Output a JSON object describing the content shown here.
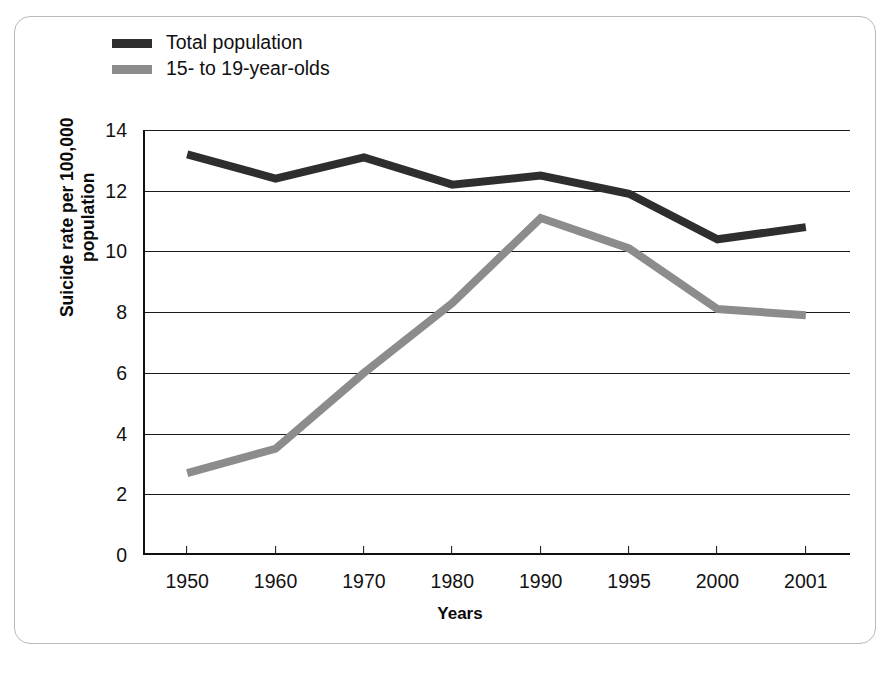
{
  "chart_data": {
    "type": "line",
    "title": "",
    "xlabel": "Years",
    "ylabel": "Suicide rate per 100,000 population",
    "ylabel_lines": [
      "Suicide rate per 100,000",
      "population"
    ],
    "categories": [
      "1950",
      "1960",
      "1970",
      "1980",
      "1990",
      "1995",
      "2000",
      "2001"
    ],
    "ylim": [
      0,
      14
    ],
    "yticks": [
      0,
      2,
      4,
      6,
      8,
      10,
      12,
      14
    ],
    "ytick_labels": [
      "0",
      "2",
      "4",
      "6",
      "8",
      "10",
      "12",
      "14"
    ],
    "grid": true,
    "grid_axis": "y",
    "legend_position": "upper-left",
    "series": [
      {
        "name": "Total population",
        "color": "#2e2e2e",
        "values": [
          13.2,
          12.4,
          13.1,
          12.2,
          12.5,
          11.9,
          10.4,
          10.8
        ]
      },
      {
        "name": "15- to 19-year-olds",
        "color": "#8c8c8c",
        "values": [
          2.7,
          3.5,
          6.0,
          8.3,
          11.1,
          10.1,
          8.1,
          7.9
        ]
      }
    ]
  },
  "legend": {
    "items": [
      {
        "label": "Total population",
        "color": "#2e2e2e"
      },
      {
        "label": "15- to 19-year-olds",
        "color": "#8c8c8c"
      }
    ]
  },
  "axes": {
    "x_title": "Years",
    "y_title_line1": "Suicide rate per 100,000",
    "y_title_line2": "population"
  },
  "colors": {
    "series_total_population": "#2e2e2e",
    "series_teens": "#8c8c8c",
    "gridline": "#1a1a1a",
    "axis": "#101010",
    "frame_border": "#b9b9b9",
    "background": "#ffffff"
  }
}
